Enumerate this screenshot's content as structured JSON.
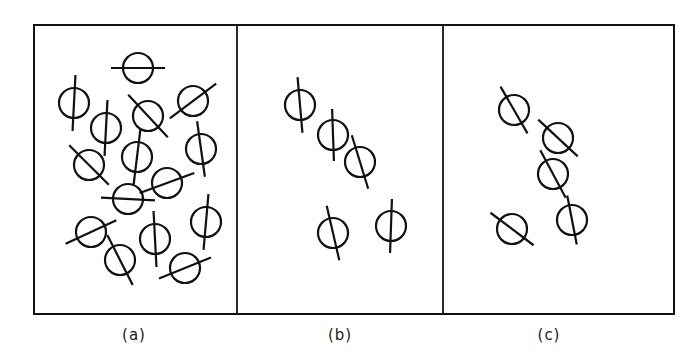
{
  "figure": {
    "stroke_color": "#111111",
    "frame": {
      "left": 34,
      "top": 25,
      "right": 674,
      "bottom": 314
    },
    "dividers": [
      237,
      443
    ],
    "symbol_radius": 15,
    "panels": [
      {
        "id": "a",
        "label": "(a)",
        "label_pos": {
          "x": 134,
          "y": 340
        },
        "symbols": [
          {
            "cx": 138,
            "cy": 68,
            "angle": 0,
            "len": 27
          },
          {
            "cx": 74,
            "cy": 103,
            "angle": 93,
            "len": 28
          },
          {
            "cx": 106,
            "cy": 128,
            "angle": 93,
            "len": 28
          },
          {
            "cx": 148,
            "cy": 116,
            "angle": 47,
            "len": 29
          },
          {
            "cx": 193,
            "cy": 101,
            "angle": -37,
            "len": 29
          },
          {
            "cx": 137,
            "cy": 157,
            "angle": 97,
            "len": 28
          },
          {
            "cx": 201,
            "cy": 149,
            "angle": 82,
            "len": 28
          },
          {
            "cx": 89,
            "cy": 165,
            "angle": 45,
            "len": 28
          },
          {
            "cx": 167,
            "cy": 183,
            "angle": -20,
            "len": 29
          },
          {
            "cx": 128,
            "cy": 199,
            "angle": 3,
            "len": 27
          },
          {
            "cx": 91,
            "cy": 232,
            "angle": -25,
            "len": 28
          },
          {
            "cx": 155,
            "cy": 239,
            "angle": 87,
            "len": 28
          },
          {
            "cx": 206,
            "cy": 222,
            "angle": 95,
            "len": 28
          },
          {
            "cx": 120,
            "cy": 260,
            "angle": 63,
            "len": 28
          },
          {
            "cx": 185,
            "cy": 268,
            "angle": -22,
            "len": 28
          }
        ]
      },
      {
        "id": "b",
        "label": "(b)",
        "label_pos": {
          "x": 340,
          "y": 340
        },
        "symbols": [
          {
            "cx": 300,
            "cy": 105,
            "angle": 85,
            "len": 28
          },
          {
            "cx": 333,
            "cy": 135,
            "angle": 88,
            "len": 26
          },
          {
            "cx": 360,
            "cy": 162,
            "angle": 73,
            "len": 28
          },
          {
            "cx": 333,
            "cy": 233,
            "angle": 77,
            "len": 28
          },
          {
            "cx": 391,
            "cy": 226,
            "angle": 92,
            "len": 27
          }
        ]
      },
      {
        "id": "c",
        "label": "(c)",
        "label_pos": {
          "x": 549,
          "y": 340
        },
        "symbols": [
          {
            "cx": 514,
            "cy": 110,
            "angle": 60,
            "len": 27
          },
          {
            "cx": 558,
            "cy": 138,
            "angle": 43,
            "len": 27
          },
          {
            "cx": 553,
            "cy": 174,
            "angle": 62,
            "len": 27
          },
          {
            "cx": 572,
            "cy": 220,
            "angle": 79,
            "len": 25
          },
          {
            "cx": 512,
            "cy": 229,
            "angle": 37,
            "len": 27
          }
        ]
      }
    ]
  }
}
